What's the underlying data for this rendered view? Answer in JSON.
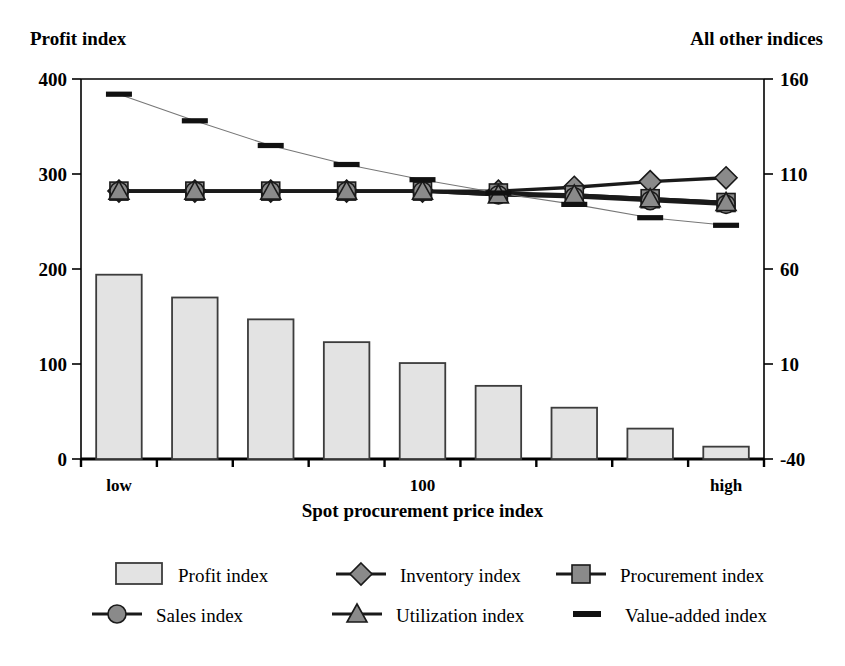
{
  "titles": {
    "left_axis": "Profit index",
    "right_axis": "All other indices",
    "x_axis": "Spot procurement price index"
  },
  "chart_data": {
    "type": "bar",
    "title": "",
    "xlabel": "Spot procurement price index",
    "ylabel": "Profit index",
    "y2label": "All other indices",
    "grid": false,
    "legend_position": "bottom",
    "categories": [
      "low",
      "",
      "",
      "",
      "100",
      "",
      "",
      "",
      "high"
    ],
    "x_tick_labels": [
      "low",
      "100",
      "high"
    ],
    "ylim": [
      0,
      400
    ],
    "y_ticks": [
      0,
      100,
      200,
      300,
      400
    ],
    "y2lim": [
      -40,
      160
    ],
    "y2_ticks": [
      -40,
      10,
      60,
      110,
      160
    ],
    "series": [
      {
        "name": "Profit index",
        "type": "bar",
        "axis": "left",
        "marker": "bar",
        "values": [
          194,
          170,
          147,
          123,
          101,
          77,
          54,
          32,
          13
        ]
      },
      {
        "name": "Inventory index",
        "type": "line",
        "axis": "right",
        "marker": "diamond",
        "values": [
          101,
          101,
          101,
          101,
          101,
          101,
          103,
          106,
          108
        ]
      },
      {
        "name": "Procurement index",
        "type": "line",
        "axis": "right",
        "marker": "square",
        "values": [
          101,
          101,
          101,
          101,
          101,
          100,
          99,
          97,
          95
        ]
      },
      {
        "name": "Sales index",
        "type": "line",
        "axis": "right",
        "marker": "circle",
        "values": [
          101,
          101,
          101,
          101,
          101,
          99,
          98,
          96,
          94
        ]
      },
      {
        "name": "Utilization index",
        "type": "line",
        "axis": "right",
        "marker": "triangle",
        "values": [
          101,
          101,
          101,
          101,
          101,
          99,
          99,
          97,
          95
        ]
      },
      {
        "name": "Value-added index",
        "type": "line",
        "axis": "right",
        "marker": "dash",
        "values": [
          152,
          138,
          125,
          115,
          107,
          100,
          94,
          87,
          83
        ]
      }
    ]
  },
  "legend": {
    "entries": [
      {
        "label": "Profit index",
        "marker": "bar"
      },
      {
        "label": "Inventory index",
        "marker": "diamond"
      },
      {
        "label": "Procurement index",
        "marker": "square"
      },
      {
        "label": "Sales index",
        "marker": "circle"
      },
      {
        "label": "Utilization index",
        "marker": "triangle"
      },
      {
        "label": "Value-added index",
        "marker": "dash"
      }
    ]
  },
  "colors": {
    "bar_fill": "#e3e3e3",
    "bar_stroke": "#3c3c3c",
    "marker_fill": "#8a8a8a",
    "marker_stroke": "#1a1a1a",
    "line": "#1a1a1a",
    "thin_line": "#777777",
    "axis": "#000000"
  }
}
